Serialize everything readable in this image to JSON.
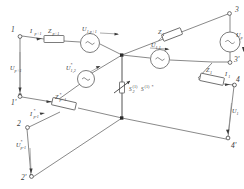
{
  "figure": {
    "type": "electrical-schematic",
    "line_color": "#6b6b6b",
    "text_color": "#3a3a3a",
    "background": "#ffffff"
  },
  "terminals": [
    {
      "id": "t1",
      "label": "1",
      "x": 18,
      "y": 34
    },
    {
      "id": "t1p",
      "label": "1'",
      "x": 18,
      "y": 97
    },
    {
      "id": "t2",
      "label": "2",
      "x": 25,
      "y": 125
    },
    {
      "id": "t2p",
      "label": "2'",
      "x": 28,
      "y": 178
    },
    {
      "id": "t3",
      "label": "3",
      "x": 230,
      "y": 12
    },
    {
      "id": "t3p",
      "label": "3'",
      "x": 212,
      "y": 62
    },
    {
      "id": "t4",
      "label": "4",
      "x": 236,
      "y": 84
    },
    {
      "id": "t4p",
      "label": "4'",
      "x": 228,
      "y": 140
    }
  ],
  "impedances": [
    {
      "id": "z-top-left",
      "label_base": "Z",
      "label_sub": "p+1"
    },
    {
      "id": "z-top-right",
      "label_base": "Z",
      "label_sub": "1"
    },
    {
      "id": "z-right",
      "label_base": "Z",
      "label_sub": "1"
    },
    {
      "id": "z-bottom-left",
      "label_base": "Z",
      "label_sub": "p+1",
      "starred": true
    }
  ],
  "currents": [
    {
      "id": "i-top-left",
      "label_base": "I",
      "label_sub": "p+1"
    },
    {
      "id": "i-bottom-left",
      "label_base": "I",
      "label_sub": "p+1",
      "starred": true
    },
    {
      "id": "i-bottom-left2",
      "label_base": "I",
      "label_sub": "p-1",
      "starred": true
    },
    {
      "id": "i-right",
      "label_base": "I",
      "label_sub": "1"
    }
  ],
  "voltages": [
    {
      "id": "u-left",
      "label_base": "U",
      "label_sub": "p+1"
    },
    {
      "id": "u-top-mid",
      "label_base": "U",
      "label_sub": "1,p+1"
    },
    {
      "id": "u-mid-src",
      "label_base": "U",
      "label_sub": "1,2",
      "starred": true
    },
    {
      "id": "u-mid-right",
      "label_base": "U",
      "label_sub": "1,1"
    },
    {
      "id": "u-far-right",
      "label_base": "U",
      "label_sub": "p"
    },
    {
      "id": "u-right-low",
      "label_base": "U",
      "label_sub": "1"
    },
    {
      "id": "u-bottom-left",
      "label_base": "U",
      "label_sub": "p-1",
      "starred": true
    }
  ],
  "sources": [
    {
      "id": "src-top",
      "symbol": "~"
    },
    {
      "id": "src-mid-left",
      "symbol": "~"
    },
    {
      "id": "src-mid-right",
      "symbol": "~"
    },
    {
      "id": "src-right",
      "symbol": "~"
    }
  ],
  "center_element": {
    "id": "variable-admittance",
    "symbol": "variable-arrow",
    "label_left_base": "S",
    "label_left_sup": "(1)",
    "label_right_base": "S",
    "label_right_sup": "(1)",
    "label_right_star": "*",
    "label_sub": "2"
  }
}
